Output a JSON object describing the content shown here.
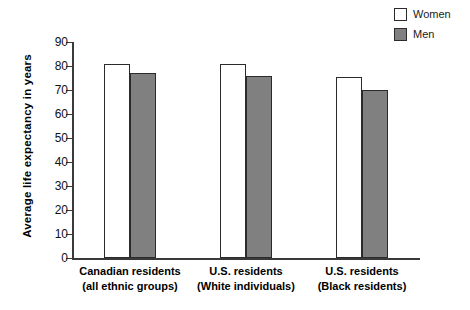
{
  "chart_data": {
    "type": "bar",
    "title": "",
    "xlabel": "",
    "ylabel": "Average life expectancy in years",
    "ylim": [
      0,
      90
    ],
    "yticks": [
      0,
      10,
      20,
      30,
      40,
      50,
      60,
      70,
      80,
      90
    ],
    "grid": false,
    "legend_position": "top-right",
    "categories": [
      "Canadian residents (all ethnic groups)",
      "U.S. residents (White individuals)",
      "U.S. residents (Black residents)"
    ],
    "category_lines": [
      [
        "Canadian residents",
        "(all ethnic groups)"
      ],
      [
        "U.S. residents",
        "(White individuals)"
      ],
      [
        "U.S. residents",
        "(Black residents)"
      ]
    ],
    "series": [
      {
        "name": "Women",
        "color": "#ffffff",
        "values": [
          81,
          81,
          75.5
        ]
      },
      {
        "name": "Men",
        "color": "#808080",
        "values": [
          77,
          76,
          70
        ]
      }
    ]
  },
  "legend": {
    "items": [
      {
        "label": "Women",
        "swatch": "white-square-icon"
      },
      {
        "label": "Men",
        "swatch": "gray-square-icon"
      }
    ]
  },
  "axis": {
    "y_title": "Average life expectancy in years",
    "y_tick_labels": [
      "90",
      "80",
      "70",
      "60",
      "50",
      "40",
      "30",
      "20",
      "10",
      "0"
    ]
  }
}
